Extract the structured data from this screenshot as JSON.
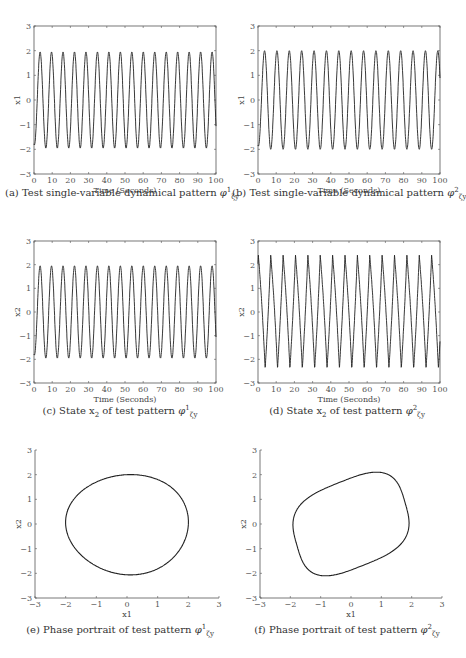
{
  "chart_data": [
    {
      "id": "a",
      "type": "line",
      "title": "(a) Test single-variable dynamical pattern φ¹ζy",
      "xlabel": "Time (Seconds)",
      "ylabel": "x1",
      "xlim": [
        0,
        100
      ],
      "ylim": [
        -3,
        3
      ],
      "xticks": [
        0,
        10,
        20,
        30,
        40,
        50,
        60,
        70,
        80,
        90,
        100
      ],
      "yticks": [
        -3,
        -2,
        -1,
        0,
        1,
        2,
        3
      ],
      "series": [
        {
          "name": "x1",
          "shape": "sinusoid",
          "amplitude": 1.95,
          "period": 6.3,
          "cycles": 16
        }
      ]
    },
    {
      "id": "b",
      "type": "line",
      "title": "(b) Test single-variable dynamical pattern φ²ζy",
      "xlabel": "Time (Seconds)",
      "ylabel": "x1",
      "xlim": [
        0,
        100
      ],
      "ylim": [
        -3,
        3
      ],
      "xticks": [
        0,
        10,
        20,
        30,
        40,
        50,
        60,
        70,
        80,
        90,
        100
      ],
      "yticks": [
        -3,
        -2,
        -1,
        0,
        1,
        2,
        3
      ],
      "series": [
        {
          "name": "x1",
          "shape": "sinusoid",
          "amplitude": 2.0,
          "period": 6.8,
          "cycles": 15
        }
      ]
    },
    {
      "id": "c",
      "type": "line",
      "title": "(c) State x2 of test pattern φ¹ζy",
      "xlabel": "Time (Seconds)",
      "ylabel": "x2",
      "xlim": [
        0,
        100
      ],
      "ylim": [
        -3,
        3
      ],
      "xticks": [
        0,
        10,
        20,
        30,
        40,
        50,
        60,
        70,
        80,
        90,
        100
      ],
      "yticks": [
        -3,
        -2,
        -1,
        0,
        1,
        2,
        3
      ],
      "series": [
        {
          "name": "x2",
          "shape": "sinusoid",
          "amplitude": 1.95,
          "period": 6.3,
          "cycles": 16
        }
      ]
    },
    {
      "id": "d",
      "type": "line",
      "title": "(d) State x2 of test pattern φ²ζy",
      "xlabel": "Time (Seconds)",
      "ylabel": "x2",
      "xlim": [
        0,
        100
      ],
      "ylim": [
        -3,
        3
      ],
      "xticks": [
        0,
        10,
        20,
        30,
        40,
        50,
        60,
        70,
        80,
        90,
        100
      ],
      "yticks": [
        -3,
        -2,
        -1,
        0,
        1,
        2,
        3
      ],
      "series": [
        {
          "name": "x2",
          "shape": "sawtooth-like",
          "amplitude": 2.4,
          "period": 6.8,
          "cycles": 15
        }
      ]
    },
    {
      "id": "e",
      "type": "line",
      "title": "(e) Phase portrait of test pattern φ¹ζy",
      "xlabel": "x1",
      "ylabel": "x2",
      "xlim": [
        -3,
        3
      ],
      "ylim": [
        -3,
        3
      ],
      "xticks": [
        -3,
        -2,
        -1,
        0,
        1,
        2,
        3
      ],
      "yticks": [
        -3,
        -2,
        -1,
        0,
        1,
        2,
        3
      ],
      "series": [
        {
          "name": "orbit",
          "shape": "closed loop",
          "x_range": [
            -2.0,
            2.0
          ],
          "y_range": [
            -2.1,
            2.0
          ]
        }
      ]
    },
    {
      "id": "f",
      "type": "line",
      "title": "(f) Phase portrait of test pattern φ²ζy",
      "xlabel": "x1",
      "ylabel": "x2",
      "xlim": [
        -3,
        3
      ],
      "ylim": [
        -3,
        3
      ],
      "xticks": [
        -3,
        -2,
        -1,
        0,
        1,
        2,
        3
      ],
      "yticks": [
        -3,
        -2,
        -1,
        0,
        1,
        2,
        3
      ],
      "series": [
        {
          "name": "orbit",
          "shape": "tilted rounded loop",
          "x_range": [
            -2.0,
            2.0
          ],
          "y_range": [
            -2.4,
            2.4
          ]
        }
      ]
    }
  ],
  "captions": {
    "a": {
      "prefix": "(a) Test single-variable dynamical pattern ",
      "sym": "φ",
      "sup": "1",
      "sub": "ζy"
    },
    "b": {
      "prefix": "(b) Test single-variable dynamical pattern ",
      "sym": "φ",
      "sup": "2",
      "sub": "ζy"
    },
    "c": {
      "prefix": "(c) State x",
      "xsub": "2",
      "mid": " of test pattern ",
      "sym": "φ",
      "sup": "1",
      "sub": "ζy"
    },
    "d": {
      "prefix": "(d) State x",
      "xsub": "2",
      "mid": " of test pattern ",
      "sym": "φ",
      "sup": "2",
      "sub": "ζy"
    },
    "e": {
      "prefix": "(e) Phase portrait of test pattern ",
      "sym": "φ",
      "sup": "1",
      "sub": "ζy"
    },
    "f": {
      "prefix": "(f) Phase portrait of test pattern ",
      "sym": "φ",
      "sup": "2",
      "sub": "ζy"
    }
  },
  "colors": {
    "line": "#222222",
    "axis": "#555555",
    "text": "#333333"
  }
}
